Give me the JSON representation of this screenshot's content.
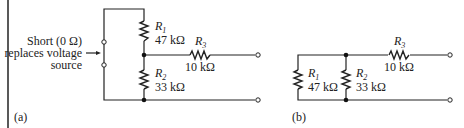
{
  "figure": {
    "panel_a": {
      "label": "(a)",
      "annotation": [
        "Short (0 Ω)",
        "replaces voltage",
        "source"
      ],
      "resistors": [
        {
          "name": "R",
          "sub": "1",
          "value": "47 kΩ"
        },
        {
          "name": "R",
          "sub": "2",
          "value": "33 kΩ"
        },
        {
          "name": "R",
          "sub": "3",
          "value": "10 kΩ"
        }
      ]
    },
    "panel_b": {
      "label": "(b)",
      "resistors": [
        {
          "name": "R",
          "sub": "1",
          "value": "47 kΩ"
        },
        {
          "name": "R",
          "sub": "2",
          "value": "33 kΩ"
        },
        {
          "name": "R",
          "sub": "3",
          "value": "10 kΩ"
        }
      ]
    },
    "colors": {
      "ink": "#222222",
      "background": "#ffffff"
    }
  }
}
